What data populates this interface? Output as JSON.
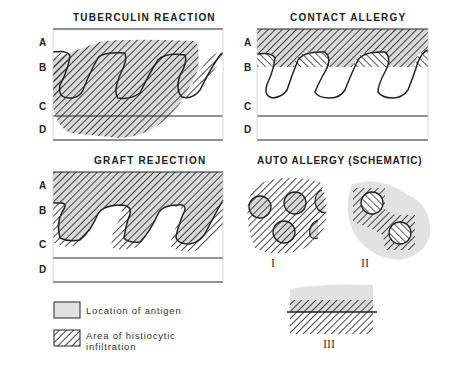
{
  "panels": {
    "tuberculin": {
      "title": "TUBERCULIN REACTION",
      "layers": [
        "A",
        "B",
        "C",
        "D"
      ]
    },
    "contact": {
      "title": "CONTACT ALLERGY",
      "layers": [
        "A",
        "B",
        "C",
        "D"
      ]
    },
    "graft": {
      "title": "GRAFT REJECTION",
      "layers": [
        "A",
        "B",
        "C",
        "D"
      ]
    },
    "auto": {
      "title": "AUTO  ALLERGY (SCHEMATIC)",
      "subfigures": [
        "I",
        "II",
        "III"
      ]
    }
  },
  "legend": {
    "antigen": "Location of antigen",
    "infiltration_line1": "Area of histiocytic",
    "infiltration_line2": "infiltration"
  },
  "colors": {
    "antigen_fill": "#e2e2e2",
    "hatch": "#333333",
    "line": "#222222"
  }
}
